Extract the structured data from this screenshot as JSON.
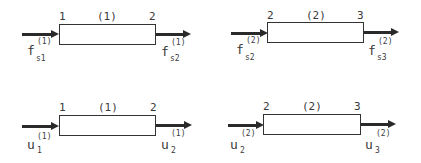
{
  "panels": [
    {
      "id": "force-element-1",
      "node_left": "1",
      "node_right": "2",
      "element": "(1)",
      "left_symbol": "f",
      "left_sub": "s1",
      "left_sup": "(1)",
      "right_symbol": "f",
      "right_sub": "s2",
      "right_sup": "(1)"
    },
    {
      "id": "force-element-2",
      "node_left": "2",
      "node_right": "3",
      "element": "(2)",
      "left_symbol": "f",
      "left_sub": "s2",
      "left_sup": "(2)",
      "right_symbol": "f",
      "right_sub": "s3",
      "right_sup": "(2)"
    },
    {
      "id": "displacement-element-1",
      "node_left": "1",
      "node_right": "2",
      "element": "(1)",
      "left_symbol": "u",
      "left_sub": "1",
      "left_sup": "(1)",
      "right_symbol": "u",
      "right_sub": "2",
      "right_sup": "(1)"
    },
    {
      "id": "displacement-element-2",
      "node_left": "2",
      "node_right": "3",
      "element": "(2)",
      "left_symbol": "u",
      "left_sub": "2",
      "left_sup": "(2)",
      "right_symbol": "u",
      "right_sub": "3",
      "right_sup": "(2)"
    }
  ]
}
